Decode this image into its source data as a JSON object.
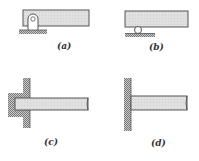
{
  "figure": {
    "panels": [
      {
        "id": "a",
        "label": "(a)",
        "support": "pin"
      },
      {
        "id": "b",
        "label": "(b)",
        "support": "roller"
      },
      {
        "id": "c",
        "label": "(c)",
        "support": "fixed-embedded"
      },
      {
        "id": "d",
        "label": "(d)",
        "support": "fixed-wall"
      }
    ]
  },
  "colors": {
    "beam_fill": "#dcdcdc",
    "outline": "#555555",
    "hatch": "#8a8a8a",
    "background": "#ffffff"
  }
}
